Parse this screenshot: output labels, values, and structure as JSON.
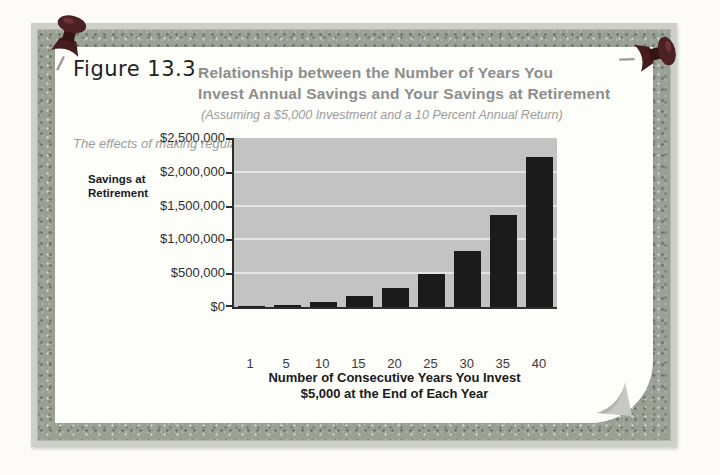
{
  "figure": {
    "label": "Figure 13.3",
    "title_line1": "Relationship between the Number of Years You",
    "title_line2": "Invest Annual Savings and Your Savings at Retirement",
    "subtitle": "(Assuming a $5,000 Investment and a 10 Percent Annual Return)",
    "caption": "The effects of making regular investments are truly impressive."
  },
  "chart_data": {
    "type": "bar",
    "ylabel_line1": "Savings at",
    "ylabel_line2": "Retirement",
    "xlabel_line1": "Number of Consecutive Years You Invest",
    "xlabel_line2": "$5,000 at the End of Each Year",
    "categories": [
      "1",
      "5",
      "10",
      "15",
      "20",
      "25",
      "30",
      "35",
      "40"
    ],
    "values": [
      5000,
      30526,
      79687,
      158862,
      286375,
      491735,
      822470,
      1355122,
      2212963
    ],
    "ylim": [
      0,
      2500000
    ],
    "yticks": [
      2500000,
      2000000,
      1500000,
      1000000,
      500000,
      0
    ],
    "ytick_labels": [
      "$2,500,000",
      "$2,000,000",
      "$1,500,000",
      "$1,000,000",
      "$500,000",
      "$0"
    ],
    "grid": "horizontal light lines every 500,000",
    "legend": "none",
    "bar_color": "#1b1b1b",
    "plot_bg": "#c3c3c3"
  },
  "decor": {
    "frame_color": "#9ba095",
    "pin_color": "#4c2123",
    "pins": [
      "pushpin-top-left",
      "pushpin-top-right"
    ]
  }
}
